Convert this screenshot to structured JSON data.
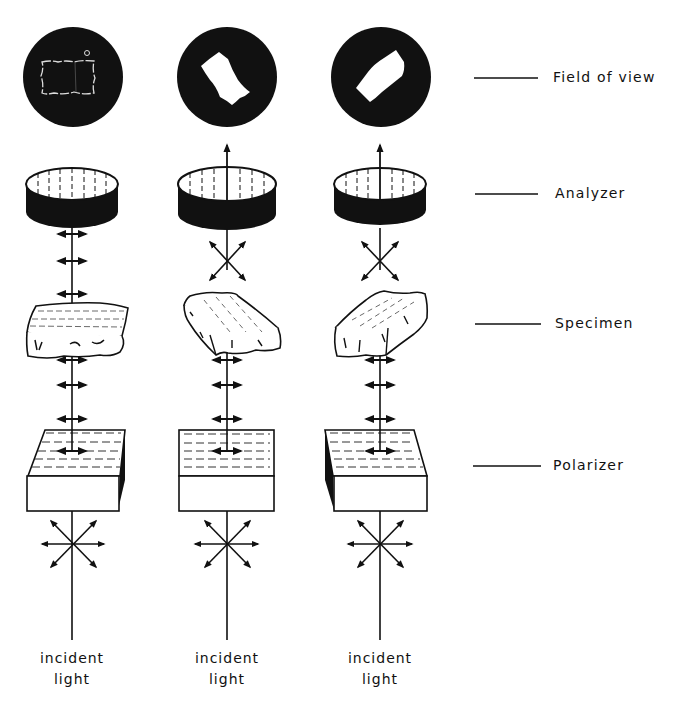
{
  "diagram": {
    "type": "polarized-light-microscopy-setup",
    "columns": [
      {
        "id": "col-1",
        "center_x": 72,
        "specimen_orientation": "parallel",
        "field_of_view": "dark (extinction, outline only)",
        "analyzer_output": "none"
      },
      {
        "id": "col-2",
        "center_x": 227,
        "specimen_orientation": "rotated-right",
        "field_of_view": "bright specimen on dark field",
        "analyzer_output": "transmitted"
      },
      {
        "id": "col-3",
        "center_x": 380,
        "specimen_orientation": "rotated-left",
        "field_of_view": "bright specimen on dark field",
        "analyzer_output": "transmitted"
      }
    ],
    "layers": [
      {
        "key": "field_of_view",
        "label": "Field of view",
        "y": 79
      },
      {
        "key": "analyzer",
        "label": "Analyzer",
        "y": 195
      },
      {
        "key": "specimen",
        "label": "Specimen",
        "y": 325
      },
      {
        "key": "polarizer",
        "label": "Polarizer",
        "y": 467
      }
    ],
    "bottom_label": {
      "line1": "incident",
      "line2": "light"
    },
    "colors": {
      "ink": "#111111",
      "background": "#ffffff"
    }
  }
}
